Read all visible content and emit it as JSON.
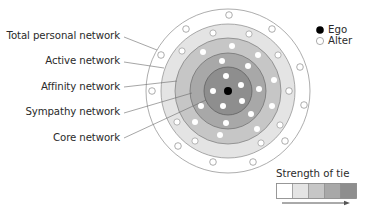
{
  "diagram": {
    "type": "concentric-network-layers",
    "center": {
      "x": 228,
      "y": 91
    },
    "rings": [
      {
        "name": "Total personal network",
        "radius": 82,
        "fill": "#ffffff"
      },
      {
        "name": "Active network",
        "radius": 67,
        "fill": "#e4e4e4"
      },
      {
        "name": "Affinity network",
        "radius": 53,
        "fill": "#c6c6c6"
      },
      {
        "name": "Sympathy network",
        "radius": 38,
        "fill": "#a8a8a8"
      },
      {
        "name": "Core network",
        "radius": 24,
        "fill": "#8e8e8e"
      }
    ],
    "ring_stroke": "#8a8a8a"
  },
  "labels": {
    "total": "Total personal network",
    "active": "Active network",
    "affinity": "Affinity network",
    "sympathy": "Sympathy network",
    "core": "Core network"
  },
  "legend": {
    "ego": "Ego",
    "alter": "Alter",
    "strength_title": "Strength of tie",
    "swatches": [
      "#ffffff",
      "#e4e4e4",
      "#c6c6c6",
      "#a8a8a8",
      "#8e8e8e"
    ]
  },
  "alters": {
    "outer": [
      [
        229,
        15
      ],
      [
        186,
        29
      ],
      [
        272,
        29
      ],
      [
        161,
        55
      ],
      [
        300,
        67
      ],
      [
        289,
        91
      ],
      [
        304,
        105
      ],
      [
        178,
        146
      ],
      [
        213,
        162
      ],
      [
        253,
        162
      ],
      [
        285,
        141
      ],
      [
        152,
        91
      ]
    ],
    "active": [
      [
        213,
        33
      ],
      [
        249,
        34
      ],
      [
        182,
        51
      ],
      [
        278,
        55
      ],
      [
        195,
        141
      ],
      [
        261,
        143
      ],
      [
        177,
        122
      ],
      [
        280,
        125
      ]
    ],
    "affinity": [
      [
        203,
        52
      ],
      [
        232,
        46
      ],
      [
        258,
        55
      ],
      [
        274,
        80
      ],
      [
        272,
        106
      ],
      [
        195,
        122
      ],
      [
        220,
        135
      ],
      [
        257,
        129
      ]
    ],
    "sympathy": [
      [
        222,
        61
      ],
      [
        248,
        66
      ],
      [
        259,
        89
      ],
      [
        201,
        106
      ],
      [
        251,
        114
      ],
      [
        226,
        123
      ]
    ],
    "core": [
      [
        226,
        76
      ],
      [
        241,
        85
      ],
      [
        213,
        91
      ],
      [
        242,
        101
      ],
      [
        223,
        106
      ]
    ]
  }
}
